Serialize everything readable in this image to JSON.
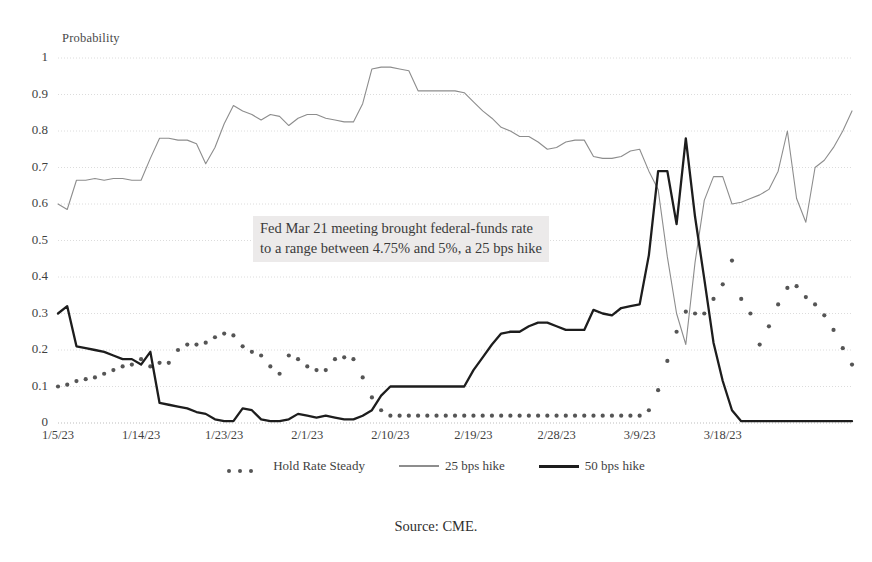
{
  "chart_data": {
    "type": "line",
    "title": "",
    "xlabel": "",
    "ylabel": "Probability",
    "ylim": [
      0,
      1
    ],
    "yticks": [
      "1",
      "0.9",
      "0.8",
      "0.7",
      "0.6",
      "0.5",
      "0.4",
      "0.3",
      "0.2",
      "0.1",
      "0"
    ],
    "ytick_values": [
      1,
      0.9,
      0.8,
      0.7,
      0.6,
      0.5,
      0.4,
      0.3,
      0.2,
      0.1,
      0
    ],
    "xticks": [
      "1/5/23",
      "1/14/23",
      "1/23/23",
      "2/1/23",
      "2/10/23",
      "2/19/23",
      "2/28/23",
      "3/9/23",
      "3/18/23"
    ],
    "xtick_index": [
      0,
      9,
      18,
      27,
      36,
      45,
      54,
      63,
      72
    ],
    "grid": "horizontal-dotted",
    "legend_position": "bottom-center",
    "annotation": "Fed Mar 21 meeting brought federal-funds rate\nto a range between 4.75% and 5%, a 25 bps hike",
    "source": "Source: CME.",
    "series": [
      {
        "name": "Hold Rate Steady",
        "style": "dotted",
        "color": "#555555",
        "values": [
          0.1,
          0.105,
          0.115,
          0.12,
          0.125,
          0.135,
          0.145,
          0.155,
          0.16,
          0.175,
          0.155,
          0.165,
          0.165,
          0.2,
          0.215,
          0.215,
          0.22,
          0.235,
          0.245,
          0.24,
          0.21,
          0.195,
          0.185,
          0.155,
          0.135,
          0.185,
          0.175,
          0.155,
          0.145,
          0.145,
          0.175,
          0.18,
          0.175,
          0.125,
          0.07,
          0.035,
          0.02,
          0.02,
          0.02,
          0.02,
          0.02,
          0.02,
          0.02,
          0.02,
          0.02,
          0.02,
          0.02,
          0.02,
          0.02,
          0.02,
          0.02,
          0.02,
          0.02,
          0.02,
          0.02,
          0.02,
          0.02,
          0.02,
          0.02,
          0.02,
          0.02,
          0.02,
          0.02,
          0.02,
          0.035,
          0.09,
          0.17,
          0.25,
          0.305,
          0.3,
          0.3,
          0.34,
          0.38,
          0.445,
          0.34,
          0.3,
          0.215,
          0.265,
          0.325,
          0.37,
          0.375,
          0.345,
          0.325,
          0.295,
          0.255,
          0.205,
          0.16
        ]
      },
      {
        "name": "25 bps hike",
        "style": "thin",
        "color": "#8d8d8d",
        "values": [
          0.6,
          0.585,
          0.665,
          0.665,
          0.67,
          0.665,
          0.67,
          0.67,
          0.665,
          0.665,
          0.725,
          0.78,
          0.78,
          0.775,
          0.775,
          0.765,
          0.71,
          0.755,
          0.82,
          0.87,
          0.855,
          0.845,
          0.83,
          0.845,
          0.84,
          0.815,
          0.835,
          0.845,
          0.845,
          0.835,
          0.83,
          0.825,
          0.825,
          0.875,
          0.97,
          0.975,
          0.975,
          0.97,
          0.965,
          0.91,
          0.91,
          0.91,
          0.91,
          0.91,
          0.905,
          0.88,
          0.855,
          0.835,
          0.81,
          0.8,
          0.785,
          0.785,
          0.77,
          0.75,
          0.755,
          0.77,
          0.775,
          0.775,
          0.73,
          0.725,
          0.725,
          0.73,
          0.745,
          0.75,
          0.69,
          0.64,
          0.455,
          0.3,
          0.215,
          0.44,
          0.61,
          0.675,
          0.675,
          0.6,
          0.605,
          0.615,
          0.625,
          0.64,
          0.69,
          0.8,
          0.615,
          0.55,
          0.7,
          0.72,
          0.755,
          0.8,
          0.855
        ]
      },
      {
        "name": "50 bps hike",
        "style": "thick",
        "color": "#1d1d1d",
        "values": [
          0.3,
          0.32,
          0.21,
          0.205,
          0.2,
          0.195,
          0.185,
          0.175,
          0.175,
          0.16,
          0.195,
          0.055,
          0.05,
          0.045,
          0.04,
          0.03,
          0.025,
          0.01,
          0.005,
          0.005,
          0.04,
          0.035,
          0.01,
          0.005,
          0.005,
          0.01,
          0.025,
          0.02,
          0.015,
          0.02,
          0.015,
          0.01,
          0.01,
          0.02,
          0.035,
          0.075,
          0.1,
          0.1,
          0.1,
          0.1,
          0.1,
          0.1,
          0.1,
          0.1,
          0.1,
          0.145,
          0.18,
          0.215,
          0.245,
          0.25,
          0.25,
          0.265,
          0.275,
          0.275,
          0.265,
          0.255,
          0.255,
          0.255,
          0.31,
          0.3,
          0.295,
          0.315,
          0.32,
          0.325,
          0.46,
          0.69,
          0.69,
          0.545,
          0.78,
          0.565,
          0.395,
          0.22,
          0.115,
          0.035,
          0.005,
          0.005,
          0.005,
          0.005,
          0.005,
          0.005,
          0.005,
          0.005,
          0.005,
          0.005,
          0.005,
          0.005,
          0.005
        ]
      }
    ]
  },
  "legend": {
    "items": [
      {
        "label": "Hold Rate Steady"
      },
      {
        "label": "25 bps hike"
      },
      {
        "label": "50 bps hike"
      }
    ]
  }
}
